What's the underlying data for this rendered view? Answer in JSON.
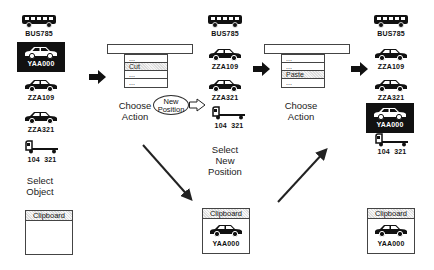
{
  "columns": [
    {
      "vehicles": [
        {
          "icon": "bus-icon",
          "label": "BUS785",
          "selected": false
        },
        {
          "icon": "car-icon",
          "label": "YAA000",
          "selected": true
        },
        {
          "icon": "car-icon",
          "label": "ZZA109",
          "selected": false
        },
        {
          "icon": "car-icon",
          "label": "ZZA321",
          "selected": false
        },
        {
          "icon": "truck-icon",
          "label": "104  321",
          "selected": false
        }
      ],
      "caption": [
        "Select",
        "Object"
      ],
      "clipboard": {
        "title": "Clipboard",
        "content": ""
      }
    },
    {
      "menu": {
        "items": [
          "...",
          "Cut",
          "...",
          "..."
        ],
        "highlighted": "Cut"
      },
      "caption": [
        "Choose",
        "Action"
      ],
      "callout": [
        "New",
        "Position"
      ]
    },
    {
      "vehicles": [
        {
          "icon": "bus-icon",
          "label": "BUS785",
          "selected": false
        },
        {
          "icon": "car-icon",
          "label": "ZZA109",
          "selected": false
        },
        {
          "icon": "car-icon",
          "label": "ZZA321",
          "selected": false
        },
        {
          "icon": "truck-icon",
          "label": "104  321",
          "selected": false
        }
      ],
      "caption": [
        "Select",
        "New",
        "Position"
      ],
      "clipboard": {
        "title": "Clipboard",
        "content": "YAA000"
      }
    },
    {
      "menu": {
        "items": [
          "...",
          "...",
          "Paste",
          "..."
        ],
        "highlighted": "Paste"
      },
      "caption": [
        "Choose",
        "Action"
      ]
    },
    {
      "vehicles": [
        {
          "icon": "bus-icon",
          "label": "BUS785",
          "selected": false
        },
        {
          "icon": "car-icon",
          "label": "ZZA109",
          "selected": false
        },
        {
          "icon": "car-icon",
          "label": "ZZA321",
          "selected": false
        },
        {
          "icon": "car-icon",
          "label": "YAA000",
          "selected": true
        },
        {
          "icon": "truck-icon",
          "label": "104  321",
          "selected": false
        }
      ],
      "clipboard": {
        "title": "Clipboard",
        "content": "YAA000"
      }
    }
  ],
  "colors": {
    "ink": "#111111",
    "menu_highlight": "#dddddd",
    "background": "#ffffff"
  }
}
